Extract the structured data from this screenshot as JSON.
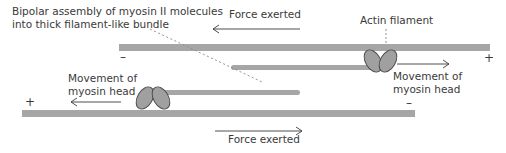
{
  "diagram": {
    "title_label": {
      "line1": "Bipolar assembly of myosin II molecules",
      "line2": "into thick filament-like bundle"
    },
    "actin_label": "Actin filament",
    "force_top_label": "Force exerted",
    "force_bottom_label": "Force exerted",
    "movement_left": {
      "line1": "Movement of",
      "line2": "myosin head"
    },
    "movement_right": {
      "line1": "Movement of",
      "line2": "myosin head"
    },
    "top_filament": {
      "minus_sign": "–",
      "plus_sign": "+"
    },
    "bottom_filament": {
      "plus_sign": "+",
      "minus_sign": "–"
    },
    "colors": {
      "filament": "#a6a6a6",
      "myosin_head": "#a0a0a0",
      "myosin_outline": "#4a4a4a",
      "text": "#3a3a3a",
      "arrow": "#3a3a3a",
      "leader": "#888888"
    }
  }
}
